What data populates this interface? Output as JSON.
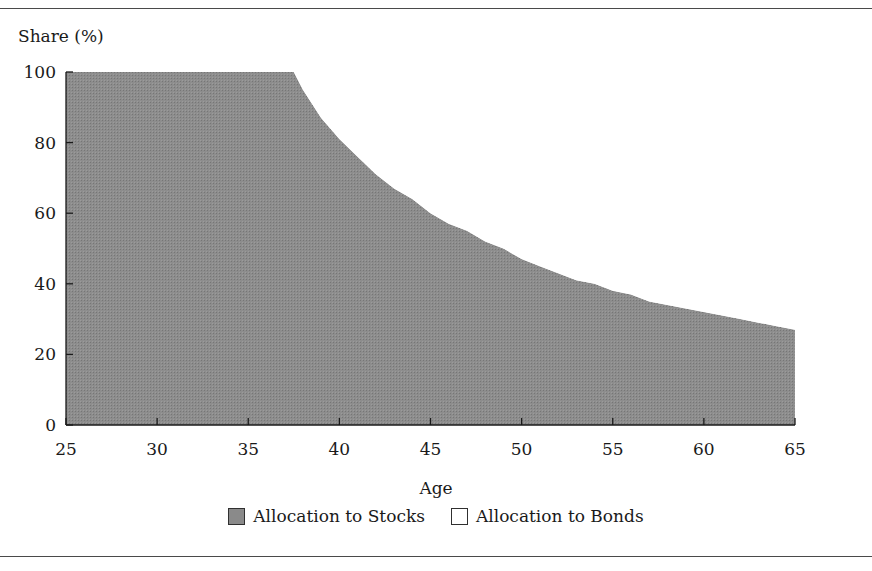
{
  "figure": {
    "background_color": "#ffffff",
    "rule_color": "#4a4a4a"
  },
  "axes": {
    "ylabel": "Share (%)",
    "xlabel": "Age",
    "y_ticks": [
      0,
      20,
      40,
      60,
      80,
      100
    ],
    "x_ticks": [
      25,
      30,
      35,
      40,
      45,
      50,
      55,
      60,
      65
    ],
    "ylim": [
      0,
      100
    ],
    "xlim": [
      25,
      65
    ],
    "grid": false
  },
  "legend": {
    "position": "below-axes-center",
    "items": [
      {
        "label": "Allocation to Stocks",
        "color": "#8a8a8a",
        "name": "stocks"
      },
      {
        "label": "Allocation to Bonds",
        "color": "#ffffff",
        "name": "bonds"
      }
    ]
  },
  "chart_data": {
    "type": "area",
    "title": "",
    "subtitle": "",
    "xlabel": "Age",
    "ylabel": "Share (%)",
    "xlim": [
      25,
      65
    ],
    "ylim": [
      0,
      100
    ],
    "grid": false,
    "legend_position": "bottom-center",
    "x_ticks": [
      25,
      30,
      35,
      40,
      45,
      50,
      55,
      60,
      65
    ],
    "y_ticks": [
      0,
      20,
      40,
      60,
      80,
      100
    ],
    "stacked": true,
    "x": [
      25,
      27,
      29,
      31,
      33,
      35,
      36,
      37,
      37.5,
      38,
      39,
      40,
      41,
      42,
      43,
      44,
      45,
      46,
      47,
      48,
      49,
      50,
      51,
      52,
      53,
      54,
      55,
      56,
      57,
      58,
      59,
      60,
      61,
      62,
      63,
      64,
      65
    ],
    "series": [
      {
        "name": "Allocation to Bonds",
        "color": "#ffffff",
        "values": [
          0,
          0,
          0,
          0,
          0,
          0,
          0,
          0,
          0,
          5,
          13,
          19,
          24,
          29,
          33,
          36,
          40,
          43,
          45,
          48,
          50,
          53,
          55,
          57,
          59,
          60,
          62,
          63,
          65,
          66,
          67,
          68,
          69,
          70,
          71,
          72,
          73
        ]
      },
      {
        "name": "Allocation to Stocks",
        "color": "#8a8a8a",
        "values": [
          100,
          100,
          100,
          100,
          100,
          100,
          100,
          100,
          100,
          95,
          87,
          81,
          76,
          71,
          67,
          64,
          60,
          57,
          55,
          52,
          50,
          47,
          45,
          43,
          41,
          40,
          38,
          37,
          35,
          34,
          33,
          32,
          31,
          30,
          29,
          28,
          27
        ]
      }
    ],
    "annotations": [
      {
        "text": "Bond allocation begins at approximately age 37.5",
        "x": 37.5,
        "y": 0
      }
    ]
  }
}
